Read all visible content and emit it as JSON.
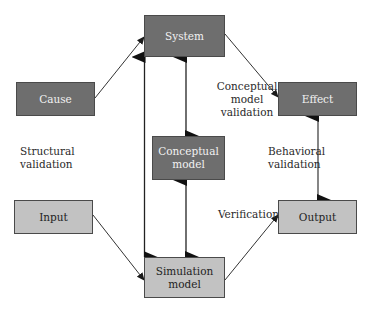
{
  "diagram": {
    "nodes": {
      "system": {
        "label": "System",
        "style": "dark"
      },
      "cause": {
        "label": "Cause",
        "style": "dark"
      },
      "effect": {
        "label": "Effect",
        "style": "dark"
      },
      "conceptual_model": {
        "label_line1": "Conceptual",
        "label_line2": "model",
        "style": "dark"
      },
      "input": {
        "label": "Input",
        "style": "light"
      },
      "output": {
        "label": "Output",
        "style": "light"
      },
      "simulation_model": {
        "label_line1": "Simulation",
        "label_line2": "model",
        "style": "light"
      }
    },
    "edge_labels": {
      "conceptual_validation": {
        "line1": "Conceptual",
        "line2": "model",
        "line3": "validation"
      },
      "structural_validation": {
        "line1": "Structural",
        "line2": "validation"
      },
      "behavioral_validation": {
        "line1": "Behavioral",
        "line2": "validation"
      },
      "verification": "Verification"
    },
    "edges": [
      {
        "from": "Cause",
        "to": "System",
        "type": "thin-arrow"
      },
      {
        "from": "System",
        "to": "Effect",
        "type": "thin-arrow"
      },
      {
        "from": "Input",
        "to": "Simulation model",
        "type": "thin-arrow"
      },
      {
        "from": "Simulation model",
        "to": "Output",
        "type": "thin-arrow"
      },
      {
        "from": "System",
        "to": "Simulation model",
        "type": "bidirectional"
      },
      {
        "from": "System",
        "to": "Conceptual model",
        "type": "bidirectional"
      },
      {
        "from": "Conceptual model",
        "to": "Simulation model",
        "type": "bidirectional"
      },
      {
        "from": "Effect",
        "to": "Output",
        "type": "bidirectional"
      }
    ],
    "colors": {
      "dark_box": "#6e6e6e",
      "light_box": "#c2c2c2",
      "line": "#1a1a1a"
    }
  }
}
